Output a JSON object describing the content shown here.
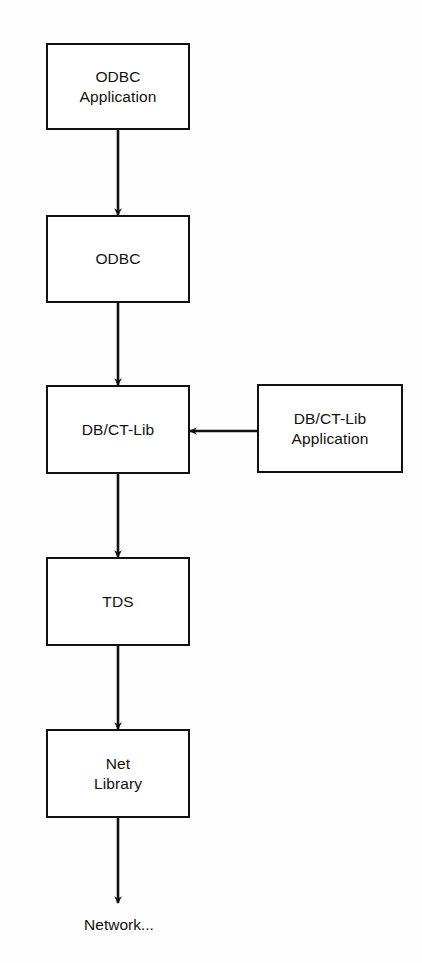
{
  "diagram": {
    "background_color": "#fefefe",
    "stroke_color": "#111111",
    "fill_color": "#ffffff",
    "nodes": [
      {
        "id": "odbc-application",
        "label": "ODBC\nApplication",
        "x": 46,
        "y": 43,
        "w": 144,
        "h": 87
      },
      {
        "id": "odbc",
        "label": "ODBC",
        "x": 46,
        "y": 215,
        "w": 144,
        "h": 88
      },
      {
        "id": "db-ct-lib",
        "label": "DB/CT-Lib",
        "x": 46,
        "y": 385,
        "w": 144,
        "h": 89
      },
      {
        "id": "db-ct-lib-application",
        "label": "DB/CT-Lib\nApplication",
        "x": 257,
        "y": 384,
        "w": 146,
        "h": 89
      },
      {
        "id": "tds",
        "label": "TDS",
        "x": 46,
        "y": 557,
        "w": 144,
        "h": 89
      },
      {
        "id": "net-library",
        "label": "Net\nLibrary",
        "x": 46,
        "y": 729,
        "w": 144,
        "h": 89
      }
    ],
    "free_labels": [
      {
        "id": "network-label",
        "label": "Network...",
        "x": 60,
        "y": 915,
        "w": 118
      }
    ],
    "edges": [
      {
        "id": "odbc-application-to-odbc",
        "from": "odbc-application",
        "to": "odbc",
        "orientation": "vertical",
        "x1": 118,
        "y1": 130,
        "x2": 118,
        "y2": 215
      },
      {
        "id": "odbc-to-db-ct-lib",
        "from": "odbc",
        "to": "db-ct-lib",
        "orientation": "vertical",
        "x1": 118,
        "y1": 303,
        "x2": 118,
        "y2": 385
      },
      {
        "id": "db-ct-lib-application-to-db-ct-lib",
        "from": "db-ct-lib-application",
        "to": "db-ct-lib",
        "orientation": "horizontal",
        "x1": 257,
        "y1": 431,
        "x2": 190,
        "y2": 431
      },
      {
        "id": "db-ct-lib-to-tds",
        "from": "db-ct-lib",
        "to": "tds",
        "orientation": "vertical",
        "x1": 118,
        "y1": 474,
        "x2": 118,
        "y2": 557
      },
      {
        "id": "tds-to-net-library",
        "from": "tds",
        "to": "net-library",
        "orientation": "vertical",
        "x1": 118,
        "y1": 646,
        "x2": 118,
        "y2": 729
      },
      {
        "id": "net-library-to-network",
        "from": "net-library",
        "to": "network-label",
        "orientation": "vertical",
        "x1": 118,
        "y1": 818,
        "x2": 118,
        "y2": 903
      }
    ]
  }
}
